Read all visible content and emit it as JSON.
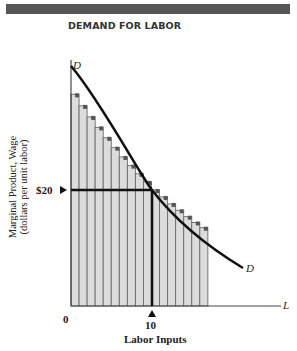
{
  "title": "DEMAND FOR LABOR",
  "chart_data": {
    "type": "bar",
    "title": "DEMAND FOR LABOR",
    "xlabel": "Labor Inputs",
    "ylabel": "Marginal Product, Wage (dollars per unit labor)",
    "x_axis_symbol": "L",
    "curve_label": "D",
    "categories": [
      1,
      2,
      3,
      4,
      5,
      6,
      7,
      8,
      9,
      10,
      11,
      12,
      13,
      14,
      15,
      16,
      17
    ],
    "values": [
      36.5,
      34.5,
      32.6,
      30.8,
      29.0,
      27.3,
      25.7,
      24.2,
      22.8,
      21.4,
      20.0,
      18.8,
      17.6,
      16.5,
      15.4,
      14.4,
      13.5
    ],
    "annotations": {
      "wage_marker": "$20",
      "labor_marker": "10",
      "origin": "0"
    },
    "grid": false,
    "legend": "none"
  },
  "labels": {
    "ylabel_line1": "Marginal Product, Wage",
    "ylabel_line2": "(dollars per unit labor)",
    "xlabel": "Labor Inputs",
    "origin": "0",
    "x_tick": "10",
    "y_tick": "$20",
    "axis_l": "L",
    "curve_d_top": "D",
    "curve_d_end": "D"
  },
  "colors": {
    "header": "#565656",
    "bar_fill": "#dcdcdc",
    "bar_divider": "#6a6a6a",
    "step": "#555555",
    "curve": "#111111"
  }
}
